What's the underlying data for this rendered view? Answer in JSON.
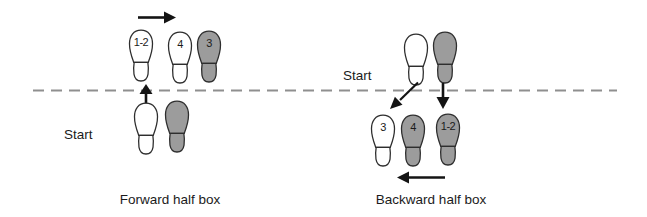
{
  "colors": {
    "footprint-gray": "#9c9c9c",
    "footprint-white": "#ffffff",
    "outline": "#2e2e2e",
    "dashed-line": "#8f8f8f",
    "arrow-black": "#141414",
    "text": "#1b1b1b"
  },
  "forward": {
    "caption": "Forward half box",
    "start_label": "Start",
    "steps_above": [
      {
        "label": "1-2",
        "fill": "white"
      },
      {
        "label": "4",
        "fill": "white"
      },
      {
        "label": "3",
        "fill": "gray"
      }
    ],
    "feet_below": [
      {
        "fill": "white"
      },
      {
        "fill": "gray"
      }
    ],
    "arrows": [
      "right",
      "up-across-line"
    ]
  },
  "backward": {
    "caption": "Backward half box",
    "start_label": "Start",
    "feet_above": [
      {
        "fill": "white"
      },
      {
        "fill": "gray"
      }
    ],
    "steps_below": [
      {
        "label": "3",
        "fill": "white"
      },
      {
        "label": "4",
        "fill": "gray"
      },
      {
        "label": "1-2",
        "fill": "gray"
      }
    ],
    "arrows": [
      "diagonal-down-left",
      "down",
      "left"
    ]
  }
}
